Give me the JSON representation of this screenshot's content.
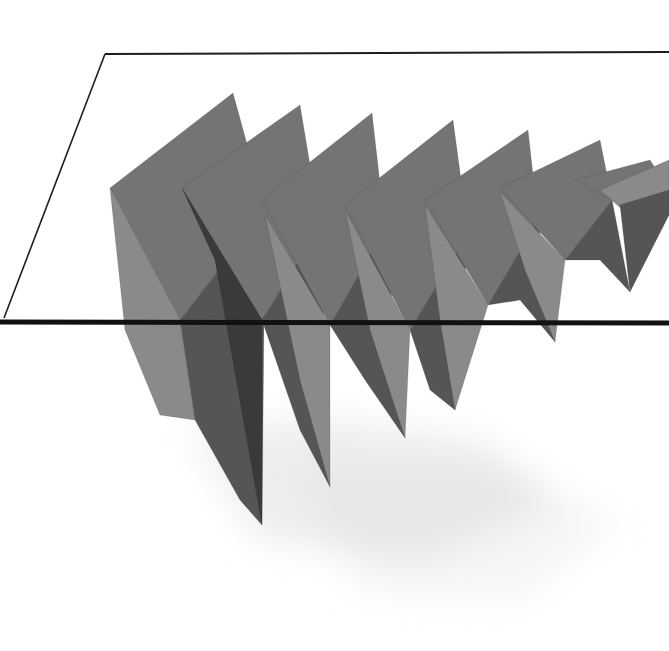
{
  "image": {
    "subject": "Glass-top table with folded zigzag gray base",
    "width": 669,
    "height": 651,
    "background": "#ffffff"
  },
  "colors": {
    "glass_edge": "#1e1e1e",
    "glass_front_edge": "#111111",
    "panel_light": "#8a8a8a",
    "panel_mid": "#747474",
    "panel_dark": "#555555",
    "panel_darkest": "#3a3a3a",
    "shadow": "#d8d8d8"
  },
  "glass": {
    "back_edge": [
      [
        105,
        54
      ],
      [
        669,
        52
      ]
    ],
    "left_edge": [
      [
        105,
        54
      ],
      [
        4,
        318
      ]
    ],
    "front_edge": [
      [
        0,
        322
      ],
      [
        669,
        323
      ]
    ]
  },
  "shadows": [
    {
      "points": "190,430 330,420 480,440 560,500 420,560 260,540",
      "opacity": 0.45
    },
    {
      "points": "300,470 500,470 620,520 520,600 360,590",
      "opacity": 0.25
    }
  ],
  "panels": [
    {
      "points": "110,188 233,93 265,210 180,320",
      "fill": "panel_mid"
    },
    {
      "points": "110,188 180,320 195,420 160,415 125,330",
      "fill": "panel_light"
    },
    {
      "points": "180,320 265,210 262,525 240,500 195,420",
      "fill": "panel_dark"
    },
    {
      "points": "182,188 300,105 320,225 262,320",
      "fill": "panel_mid"
    },
    {
      "points": "182,188 262,320 262,525 215,260",
      "fill": "panel_darkest"
    },
    {
      "points": "262,320 320,225 330,487 300,430",
      "fill": "panel_dark"
    },
    {
      "points": "262,200 372,113 385,228 330,325",
      "fill": "panel_mid"
    },
    {
      "points": "265,215 330,325 330,487 300,380",
      "fill": "panel_light"
    },
    {
      "points": "330,325 385,228 405,438 365,380",
      "fill": "panel_dark"
    },
    {
      "points": "345,205 453,120 468,232 410,330",
      "fill": "panel_mid"
    },
    {
      "points": "345,210 410,330 405,438 370,330",
      "fill": "panel_light"
    },
    {
      "points": "410,330 468,232 455,410 430,390",
      "fill": "panel_dark"
    },
    {
      "points": "425,200 528,130 538,220 488,305",
      "fill": "panel_mid"
    },
    {
      "points": "425,205 488,305 455,410 440,320",
      "fill": "panel_light"
    },
    {
      "points": "488,305 538,220 555,342 520,300",
      "fill": "panel_dark"
    },
    {
      "points": "500,188 600,140 612,200 565,260",
      "fill": "panel_mid"
    },
    {
      "points": "500,192 565,260 555,342 525,270",
      "fill": "panel_light"
    },
    {
      "points": "565,260 612,200 630,292 600,260",
      "fill": "panel_dark"
    },
    {
      "points": "575,180 650,160 669,190 620,205",
      "fill": "panel_mid"
    },
    {
      "points": "600,190 669,160 669,215 640,225",
      "fill": "panel_light"
    },
    {
      "points": "620,205 669,190 669,215 630,292",
      "fill": "panel_dark"
    }
  ]
}
